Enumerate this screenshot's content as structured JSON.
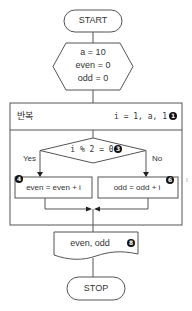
{
  "flowchart": {
    "start": {
      "label": "START"
    },
    "init": {
      "lines": [
        "a = 10",
        "even = 0",
        "odd = 0"
      ]
    },
    "loop": {
      "title": "반복",
      "range": "i = 1, a, 1",
      "marker": "1"
    },
    "condition": {
      "expr": "i % 2 = 0",
      "marker": "3",
      "yes_label": "Yes",
      "no_label": "No"
    },
    "even_step": {
      "text": "even = even + i",
      "marker": "4"
    },
    "odd_step": {
      "text": "odd = odd + i",
      "marker": "6"
    },
    "output": {
      "text": "even, odd",
      "marker": "8"
    },
    "stop": {
      "label": "STOP"
    }
  },
  "colors": {
    "line": "#555555",
    "text": "#333333",
    "marker_bg": "#111111"
  }
}
